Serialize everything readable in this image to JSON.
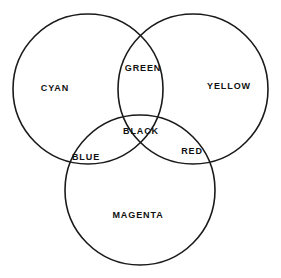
{
  "diagram": {
    "background_color": "#ffffff",
    "stroke_color": "#1a1a1a",
    "stroke_width": 1.6,
    "canvas": {
      "width": 281,
      "height": 278
    },
    "circles": [
      {
        "name": "cyan-circle",
        "label": "CYAN",
        "cx": 88,
        "cy": 89,
        "r": 75
      },
      {
        "name": "yellow-circle",
        "label": "YELLOW",
        "cx": 193,
        "cy": 89,
        "r": 75
      },
      {
        "name": "magenta-circle",
        "label": "MAGENTA",
        "cx": 140,
        "cy": 190,
        "r": 75
      }
    ],
    "labels": [
      {
        "id": "cyan",
        "text": "CYAN",
        "x": 55,
        "y": 88,
        "region": "cyan-only"
      },
      {
        "id": "green",
        "text": "GREEN",
        "x": 143,
        "y": 68,
        "region": "cyan-yellow"
      },
      {
        "id": "yellow",
        "text": "YELLOW",
        "x": 229,
        "y": 86,
        "region": "yellow-only"
      },
      {
        "id": "black",
        "text": "BLACK",
        "x": 141,
        "y": 131,
        "region": "cyan-yellow-magenta"
      },
      {
        "id": "blue",
        "text": "BLUE",
        "x": 86,
        "y": 157,
        "region": "cyan-magenta"
      },
      {
        "id": "red",
        "text": "RED",
        "x": 192,
        "y": 151,
        "region": "yellow-magenta"
      },
      {
        "id": "magenta",
        "text": "MAGENTA",
        "x": 138,
        "y": 215,
        "region": "magenta-only"
      }
    ]
  }
}
